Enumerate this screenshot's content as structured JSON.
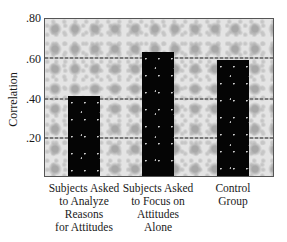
{
  "chart_data": {
    "type": "bar",
    "title": "",
    "xlabel": "",
    "ylabel": "Correlation",
    "ylim": [
      0,
      0.8
    ],
    "yticks": [
      ".20",
      ".40",
      ".60",
      ".80"
    ],
    "grid": true,
    "legend": null,
    "categories": [
      "Subjects Asked to Analyze Reasons for Attitudes",
      "Subjects Asked to Focus on Attitudes Alone",
      "Control Group"
    ],
    "category_lines": [
      [
        "Subjects Asked",
        "to Analyze",
        "Reasons",
        "for Attitudes"
      ],
      [
        "Subjects Asked",
        "to Focus on",
        "Attitudes",
        "Alone"
      ],
      [
        "Control",
        "Group"
      ]
    ],
    "values": [
      0.41,
      0.63,
      0.59
    ],
    "bar_color": "#050505",
    "background_color": "#e4e4e4"
  }
}
